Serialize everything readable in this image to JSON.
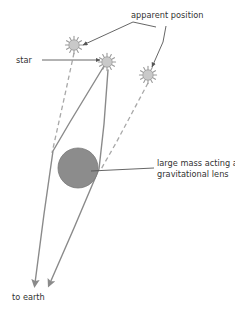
{
  "diagram": {
    "background_color": "#ffffff",
    "labels": {
      "apparent_position": "apparent position",
      "star": "star",
      "large_mass_line1": "large mass acting as",
      "large_mass_line2": "gravitational lens",
      "to_earth": "to earth"
    },
    "colors": {
      "line": "#8a8a8a",
      "dashed_line": "#a8a8a8",
      "leader": "#555555",
      "text": "#333333",
      "star_fill": "#c9c9c9",
      "star_stroke": "#9a9a9a",
      "lens_fill": "#8c8c8c",
      "lens_stroke": "#7a7a7a"
    },
    "stars": [
      {
        "name": "apparent-star-left",
        "role": "apparent position",
        "cx": 74,
        "cy": 45,
        "r": 7.5,
        "spikes": 12
      },
      {
        "name": "real-star-center",
        "role": "star",
        "cx": 107,
        "cy": 62,
        "r": 7.5,
        "spikes": 12
      },
      {
        "name": "apparent-star-right",
        "role": "apparent position",
        "cx": 148,
        "cy": 75,
        "r": 7.5,
        "spikes": 12
      }
    ],
    "lens": {
      "name": "gravitational-lens-mass",
      "cx": 78,
      "cy": 168,
      "r": 20
    },
    "light_paths": [
      {
        "name": "light-path-left",
        "description": "bent light ray passing left of the mass toward earth",
        "points": "107,62 52,152 33,288"
      },
      {
        "name": "light-path-right",
        "description": "bent light ray passing right of the mass toward earth",
        "points": "107,62 99,170 48,288"
      }
    ],
    "apparent_lines": [
      {
        "name": "apparent-line-left",
        "description": "dashed line from left apparent position to observer sightline",
        "points": "74,52 52,152"
      },
      {
        "name": "apparent-line-right",
        "description": "dashed line from right apparent position to observer sightline",
        "points": "148,82 99,170"
      }
    ],
    "leaders": [
      {
        "name": "leader-apparent-position-left",
        "points": "153,27 133,20 79,47"
      },
      {
        "name": "leader-apparent-position-right",
        "points": "163,25 162,40 150,68"
      },
      {
        "name": "leader-star",
        "points": "41,61 103,61"
      },
      {
        "name": "leader-large-mass",
        "points": "152,168 88,170"
      }
    ],
    "arrows": [
      {
        "name": "arrow-to-earth-left",
        "x": 33,
        "y": 288
      },
      {
        "name": "arrow-to-earth-right",
        "x": 48,
        "y": 288
      }
    ],
    "text_positions": {
      "apparent_position": {
        "x": 131,
        "y": 18
      },
      "star": {
        "x": 16,
        "y": 64
      },
      "large_mass_line1": {
        "x": 157,
        "y": 166
      },
      "large_mass_line2": {
        "x": 157,
        "y": 177
      },
      "to_earth": {
        "x": 12,
        "y": 300
      }
    }
  }
}
